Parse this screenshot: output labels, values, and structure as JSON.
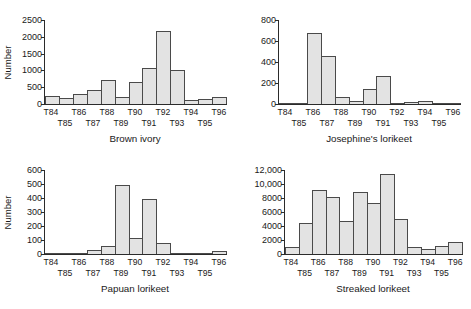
{
  "figure": {
    "background": "#ffffff",
    "bar_fill": "#e3e3e3",
    "bar_stroke": "#4a4a4a",
    "axis_color": "#2b2b2b"
  },
  "chart_data": [
    {
      "type": "bar",
      "title": "Brown ivory",
      "xlabel": "",
      "ylabel": "Number",
      "categories": [
        "T84",
        "T85",
        "T86",
        "T87",
        "T88",
        "T89",
        "T90",
        "T91",
        "T92",
        "T93",
        "T94",
        "T95",
        "T96"
      ],
      "values": [
        240,
        185,
        300,
        420,
        700,
        215,
        655,
        1060,
        2160,
        1020,
        110,
        155,
        205
      ],
      "ylim": [
        0,
        2500
      ],
      "yticks": [
        0,
        500,
        1000,
        1500,
        2000,
        2500
      ],
      "ytick_labels": [
        "0",
        "500",
        "1000",
        "1500",
        "2000",
        "2500"
      ],
      "grid": false,
      "legend": "none"
    },
    {
      "type": "bar",
      "title": "Josephine's lorikeet",
      "xlabel": "",
      "ylabel": "",
      "categories": [
        "T84",
        "T85",
        "T86",
        "T87",
        "T88",
        "T89",
        "T90",
        "T91",
        "T92",
        "T93",
        "T94",
        "T95",
        "T96"
      ],
      "values": [
        8,
        12,
        680,
        455,
        70,
        30,
        145,
        270,
        2,
        15,
        28,
        12,
        10
      ],
      "ylim": [
        0,
        800
      ],
      "yticks": [
        0,
        200,
        400,
        600,
        800
      ],
      "ytick_labels": [
        "0",
        "200",
        "400",
        "600",
        "800"
      ],
      "grid": false,
      "legend": "none"
    },
    {
      "type": "bar",
      "title": "Papuan lorikeet",
      "xlabel": "",
      "ylabel": "Number",
      "categories": [
        "T84",
        "T85",
        "T86",
        "T87",
        "T88",
        "T89",
        "T90",
        "T91",
        "T92",
        "T93",
        "T94",
        "T95",
        "T96"
      ],
      "values": [
        0,
        0,
        0,
        30,
        55,
        490,
        115,
        390,
        80,
        0,
        0,
        0,
        25
      ],
      "ylim": [
        0,
        600
      ],
      "yticks": [
        0,
        100,
        200,
        300,
        400,
        500,
        600
      ],
      "ytick_labels": [
        "0",
        "100",
        "200",
        "300",
        "400",
        "500",
        "600"
      ],
      "grid": false,
      "legend": "none"
    },
    {
      "type": "bar",
      "title": "Streaked lorikeet",
      "xlabel": "",
      "ylabel": "",
      "categories": [
        "T84",
        "T85",
        "T86",
        "T87",
        "T88",
        "T89",
        "T90",
        "T91",
        "T92",
        "T93",
        "T94",
        "T95",
        "T96"
      ],
      "values": [
        1000,
        4500,
        9100,
        8150,
        4650,
        8800,
        7300,
        11500,
        5050,
        1000,
        650,
        1150,
        1700
      ],
      "ylim": [
        0,
        12000
      ],
      "yticks": [
        0,
        2000,
        4000,
        6000,
        8000,
        10000,
        12000
      ],
      "ytick_labels": [
        "0",
        "2000",
        "4000",
        "6000",
        "8000",
        "10,000",
        "12,000"
      ],
      "grid": false,
      "legend": "none"
    }
  ]
}
